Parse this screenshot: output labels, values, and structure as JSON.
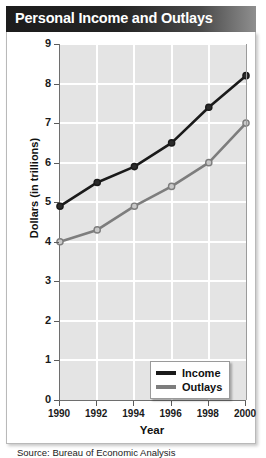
{
  "title": "Personal Income and Outlays",
  "source_note": "Source: Bureau of Economic Analysis",
  "colors": {
    "income_line": "#1a1a1a",
    "outlays_line": "#7d7d7d",
    "plot_background": "#e4e4e4",
    "gridline": "#ffffff",
    "axis": "#6e6e6e",
    "title_bar_dark": "#1c1c1c",
    "title_bar_light": "#8f8f8f"
  },
  "chart_data": {
    "type": "line",
    "title": "Personal Income and Outlays",
    "xlabel": "Year",
    "ylabel": "Dollars (in trillions)",
    "x": [
      1990,
      1992,
      1994,
      1996,
      1998,
      2000
    ],
    "xticklabels": [
      "1990",
      "1992",
      "1994",
      "1996",
      "1998",
      "2000"
    ],
    "xlim": [
      1990,
      2000
    ],
    "ylim": [
      0,
      9
    ],
    "yticks": [
      0,
      1,
      2,
      3,
      4,
      5,
      6,
      7,
      8,
      9
    ],
    "yticklabels": [
      "0",
      "1",
      "2",
      "3",
      "4",
      "5",
      "6",
      "7",
      "8",
      "9"
    ],
    "grid": true,
    "legend_position": "bottom-right",
    "series": [
      {
        "name": "Income",
        "color": "#1a1a1a",
        "values": [
          4.9,
          5.5,
          5.9,
          6.5,
          7.4,
          8.2
        ]
      },
      {
        "name": "Outlays",
        "color": "#7d7d7d",
        "values": [
          4.0,
          4.3,
          4.9,
          5.4,
          6.0,
          7.0
        ]
      }
    ]
  }
}
